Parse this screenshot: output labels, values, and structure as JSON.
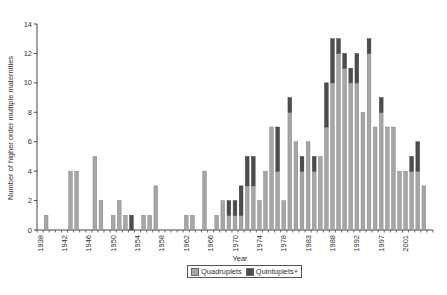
{
  "chart_data": {
    "type": "bar",
    "stacked": true,
    "title": "",
    "xlabel": "Year",
    "ylabel": "Number of higher order multiple maternities",
    "ylim": [
      0,
      14
    ],
    "yticks": [
      0,
      2,
      4,
      6,
      8,
      10,
      12,
      14
    ],
    "grid": false,
    "legend_position": "bottom",
    "x_tick_labels": [
      {
        "index": 0,
        "label": "1938"
      },
      {
        "index": 4,
        "label": "1942"
      },
      {
        "index": 8,
        "label": "1946"
      },
      {
        "index": 12,
        "label": "1950"
      },
      {
        "index": 16,
        "label": "1954"
      },
      {
        "index": 20,
        "label": "1958"
      },
      {
        "index": 24,
        "label": "1962"
      },
      {
        "index": 28,
        "label": "1966"
      },
      {
        "index": 32,
        "label": "1970"
      },
      {
        "index": 36,
        "label": "1974"
      },
      {
        "index": 40,
        "label": "1978"
      },
      {
        "index": 44,
        "label": "1983"
      },
      {
        "index": 48,
        "label": "1988"
      },
      {
        "index": 52,
        "label": "1992"
      },
      {
        "index": 56,
        "label": "1997"
      },
      {
        "index": 60,
        "label": "2001"
      }
    ],
    "slot_count": 65,
    "series": [
      {
        "name": "Quadruplets",
        "color": "#a6a6a6",
        "values": [
          0,
          1,
          0,
          0,
          0,
          4,
          4,
          0,
          0,
          5,
          2,
          0,
          1,
          2,
          1,
          0,
          0,
          1,
          1,
          3,
          0,
          0,
          0,
          0,
          1,
          1,
          0,
          4,
          0,
          1,
          2,
          1,
          1,
          1,
          3,
          3,
          2,
          4,
          7,
          4,
          2,
          8,
          6,
          4,
          6,
          4,
          5,
          7,
          10,
          12,
          11,
          10,
          10,
          8,
          12,
          7,
          8,
          7,
          7,
          4,
          4,
          4,
          4,
          3,
          0
        ]
      },
      {
        "name": "Quintuplets+",
        "color": "#4d4d4d",
        "values": [
          0,
          0,
          0,
          0,
          0,
          0,
          0,
          0,
          0,
          0,
          0,
          0,
          0,
          0,
          0,
          1,
          0,
          0,
          0,
          0,
          0,
          0,
          0,
          0,
          0,
          0,
          0,
          0,
          0,
          0,
          0,
          1,
          1,
          2,
          2,
          2,
          0,
          0,
          0,
          3,
          0,
          1,
          0,
          1,
          0,
          1,
          0,
          3,
          3,
          1,
          1,
          1,
          2,
          0,
          1,
          0,
          1,
          0,
          0,
          0,
          0,
          1,
          2,
          0,
          0
        ]
      }
    ]
  },
  "legend": {
    "items": [
      {
        "label": "Quadruplets",
        "color": "#a6a6a6"
      },
      {
        "label": "Quintuplets+",
        "color": "#4d4d4d"
      }
    ]
  }
}
